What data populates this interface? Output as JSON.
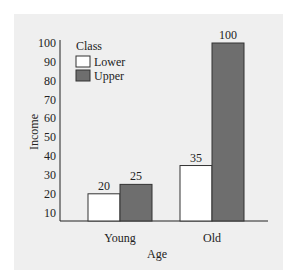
{
  "chart_data": {
    "type": "bar",
    "title": "",
    "xlabel": "Age",
    "ylabel": "Income",
    "categories": [
      "Young",
      "Old"
    ],
    "series": [
      {
        "name": "Lower",
        "values": [
          20,
          35
        ],
        "color": "#ffffff"
      },
      {
        "name": "Upper",
        "values": [
          25,
          100
        ],
        "color": "#6e6e6e"
      }
    ],
    "yticks": [
      10,
      20,
      30,
      40,
      50,
      60,
      70,
      80,
      90,
      100
    ],
    "ylim": [
      0,
      100
    ],
    "grid": false,
    "legend": {
      "title": "Class",
      "position": "upper-left",
      "entries": [
        "Lower",
        "Upper"
      ]
    },
    "data_labels": true
  }
}
